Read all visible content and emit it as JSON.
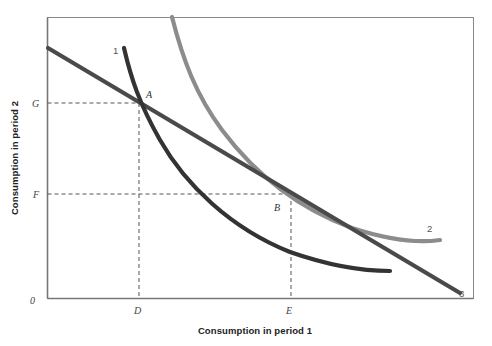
{
  "figure": {
    "width": 492,
    "height": 346,
    "background": "#ffffff",
    "frame_color": "#8a8a8a"
  },
  "axes": {
    "x_title": "Consumption in period 1",
    "y_title": "Consumption in period 2",
    "origin_label": "0",
    "x_ticks": [
      {
        "label": "D",
        "x": 139
      },
      {
        "label": "E",
        "x": 291
      }
    ],
    "y_ticks": [
      {
        "label": "G",
        "y": 103
      },
      {
        "label": "F",
        "y": 194
      }
    ]
  },
  "points": [
    {
      "label": "A",
      "x": 139,
      "y": 103,
      "description": "tangency of budget line with indifference curve 1"
    },
    {
      "label": "B",
      "x": 291,
      "y": 194,
      "description": "tangency of budget line with indifference curve 2"
    }
  ],
  "curve_labels": [
    {
      "label": "1",
      "x": 116,
      "y": 51,
      "color": "#333333"
    },
    {
      "label": "2",
      "x": 430,
      "y": 229,
      "color": "#555555"
    },
    {
      "label": "3",
      "x": 463,
      "y": 293,
      "color": "#555555"
    }
  ],
  "chart_data": {
    "type": "line",
    "title": "",
    "xlabel": "Consumption in period 1",
    "ylabel": "Consumption in period 2",
    "grid": false,
    "legend": "inline-curve-labels",
    "xlim": [
      0,
      1
    ],
    "ylim": [
      0,
      1
    ],
    "series": [
      {
        "name": "1",
        "role": "indifference-curve-low",
        "color": "#333333",
        "path": "M124,48 C131,78 139,103 160,140 C185,184 230,228 290,252 C330,266 365,271 390,271",
        "description": "lower indifference curve, convex to origin, passes through point A"
      },
      {
        "name": "2",
        "role": "indifference-curve-high",
        "color": "#8c8c8c",
        "path": "M172,17 C183,60 196,95 222,130 C258,178 300,209 352,228 C392,241 420,243 440,240",
        "description": "higher indifference curve, convex to origin, passes through point B"
      },
      {
        "name": "3",
        "role": "budget-constraint",
        "color": "#4a4a4a",
        "path": "M48,48 L460,293",
        "description": "intertemporal budget constraint, straight downward sloping line"
      }
    ],
    "guides": [
      {
        "type": "dashed-horizontal",
        "from": [
          47,
          103
        ],
        "to": [
          139,
          103
        ],
        "anchor": "G to A"
      },
      {
        "type": "dashed-vertical",
        "from": [
          139,
          103
        ],
        "to": [
          298,
          298
        ],
        "anchor": "A to D"
      },
      {
        "type": "dashed-horizontal",
        "from": [
          47,
          194
        ],
        "to": [
          291,
          194
        ],
        "anchor": "F to B"
      },
      {
        "type": "dashed-vertical",
        "from": [
          291,
          194
        ],
        "to": [
          291,
          298
        ],
        "anchor": "B to E"
      }
    ]
  }
}
